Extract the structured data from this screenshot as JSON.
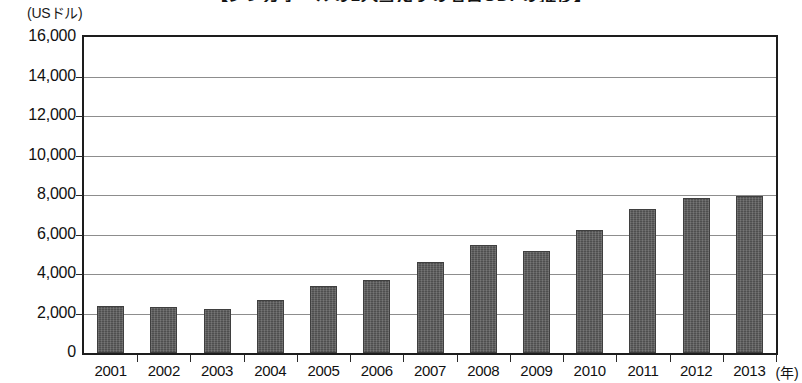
{
  "chart_data": {
    "type": "bar",
    "title": "【シンガポールの1人当たりの名目GDPの推移】",
    "subtitle": "",
    "unit_label": "(USドル)",
    "xlabel": "(年)",
    "ylabel": "",
    "categories": [
      "2001",
      "2002",
      "2003",
      "2004",
      "2005",
      "2006",
      "2007",
      "2008",
      "2009",
      "2010",
      "2011",
      "2012",
      "2013"
    ],
    "values": [
      2400,
      2350,
      2250,
      2700,
      3400,
      3700,
      4600,
      5450,
      5150,
      6250,
      7300,
      7850,
      7950
    ],
    "ylim": [
      0,
      16000
    ],
    "ytick_step": 2000,
    "ytick_labels": [
      "16,000",
      "14,000",
      "12,000",
      "10,000",
      "8,000",
      "6,000",
      "4,000",
      "2,000",
      "0"
    ],
    "ytick_values": [
      16000,
      14000,
      12000,
      10000,
      8000,
      6000,
      4000,
      2000,
      0
    ],
    "grid": true,
    "legend": null,
    "bar_color": "#5a5a5a",
    "axis_color": "#1d1d1d",
    "grid_color": "#8d8d8d"
  }
}
